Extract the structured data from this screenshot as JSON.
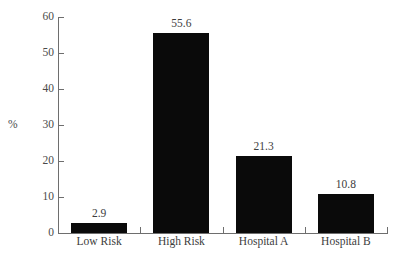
{
  "chart_data": {
    "type": "bar",
    "title": "",
    "subtitle": "",
    "xlabel": "",
    "ylabel": "%",
    "categories": [
      "Low Risk",
      "High Risk",
      "Hospital A",
      "Hospital B"
    ],
    "values": [
      2.9,
      55.6,
      21.3,
      10.8
    ],
    "value_labels": [
      "2.9",
      "55.6",
      "21.3",
      "10.8"
    ],
    "ylim": [
      0,
      60
    ],
    "ytick_labels": [
      "0",
      "10",
      "20",
      "30",
      "40",
      "50",
      "60"
    ],
    "ytick_values": [
      0,
      10,
      20,
      30,
      40,
      50,
      60
    ],
    "grid": false,
    "legend": false,
    "legend_position": "none",
    "bar_color": "#0a0a0a",
    "axis_color": "#6e6e6e",
    "text_color": "#3d3d3d",
    "background_color": "#ffffff"
  }
}
